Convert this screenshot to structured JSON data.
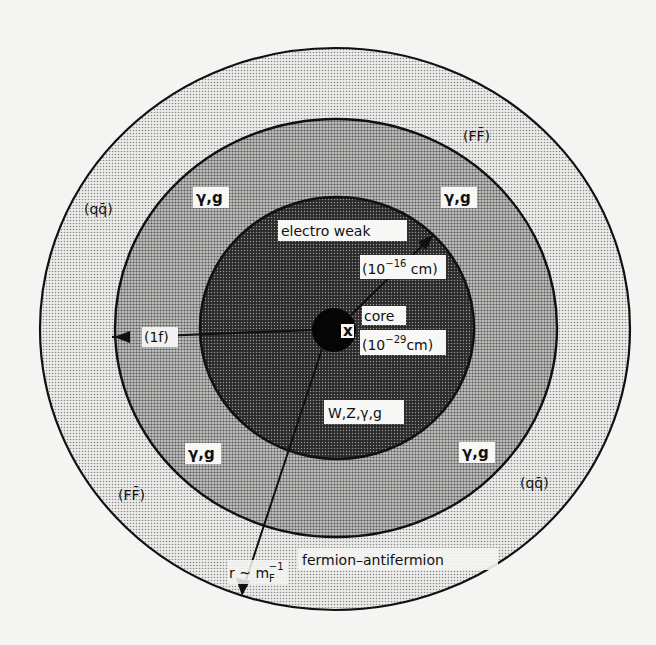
{
  "diagram": {
    "title": "",
    "regions": [
      {
        "id": "core",
        "label": "core",
        "scale": "(10⁻²⁹ cm)",
        "marker": "x"
      },
      {
        "id": "electroweak",
        "label": "electro weak",
        "scale": "(10⁻¹⁶ cm)",
        "particles": "W,Z,γ,g"
      },
      {
        "id": "middle",
        "particles": [
          "γ,g",
          "γ,g",
          "γ,g",
          "γ,g"
        ]
      },
      {
        "id": "outer",
        "pairs": [
          "(qq̄)",
          "(FF̄)",
          "(FF̄)",
          "(qq̄)"
        ],
        "label": "fermion-antifermion"
      }
    ],
    "labels": {
      "core": "core",
      "core_scale": "(10",
      "core_exp": "−29",
      "core_unit": "cm)",
      "core_marker": "x",
      "electroweak": "electro weak",
      "ew_scale": "(10",
      "ew_exp": "−16",
      "ew_unit": " cm)",
      "ew_particles": "W,Z,γ,g",
      "gamma_g_tl": "γ,g",
      "gamma_g_tr": "γ,g",
      "gamma_g_bl": "γ,g",
      "gamma_g_br": "γ,g",
      "qqbar_left": "(qq̄)",
      "ffbar_top": "(FF̄)",
      "ffbar_bottom": "(FF̄)",
      "qqbar_right": "(qq̄)",
      "one_fermi": "(1f)",
      "radius_r": "r ~ m",
      "radius_sub": "F",
      "radius_sup": "−1",
      "fermion_antifermion": "fermion–antifermion"
    },
    "colors": {
      "background": "#f4f4f2",
      "outer_fill": "#d8d8d6",
      "middle_fill": "#a6a6a4",
      "inner_fill": "#4a4a4a",
      "core_fill": "#050505",
      "ink": "#111111",
      "label_bg": "#f7f7f5"
    }
  }
}
